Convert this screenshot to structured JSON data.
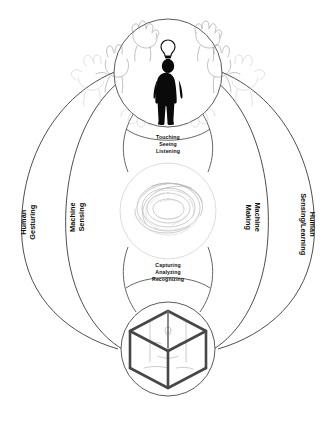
{
  "diagram": {
    "type": "cyclical-interaction-diagram",
    "background_color": "#ffffff",
    "nodes": [
      {
        "id": "human",
        "position": "top",
        "icon": "human-silhouette-with-lightbulb",
        "surrounding_icon": "gesturing-hands-sketches"
      },
      {
        "id": "computation",
        "position": "middle",
        "icon": "tangled-mesh-swirl"
      },
      {
        "id": "machine",
        "position": "bottom",
        "icon": "wireframe-cube-3d-printer"
      }
    ],
    "inner_labels": [
      {
        "id": "top-inner",
        "lines": [
          "Touching",
          "Seeing",
          "Listening"
        ]
      },
      {
        "id": "bottom-inner",
        "lines": [
          "Capturing",
          "Analyzing",
          "Recognizing"
        ]
      }
    ],
    "arc_labels": [
      {
        "id": "human-gesturing",
        "side": "left-outer",
        "lines": [
          "Human",
          "Gesturing"
        ],
        "orientation": "rotated-ccw"
      },
      {
        "id": "machine-sensing",
        "side": "left-inner",
        "lines": [
          "Machine",
          "Sensing"
        ],
        "orientation": "rotated-ccw"
      },
      {
        "id": "machine-making",
        "side": "right-inner",
        "lines": [
          "Machine",
          "Making"
        ],
        "orientation": "rotated-cw"
      },
      {
        "id": "human-sensing-learning",
        "side": "right-outer",
        "lines": [
          "Human",
          "Sensing/Learning"
        ],
        "orientation": "rotated-cw"
      }
    ],
    "colors": {
      "line": "#3a3a3a",
      "silhouette": "#0a0a0a",
      "light_outline": "#d8d8d8",
      "mesh": "#a9a9a9",
      "cube": "#474747",
      "text": "#111111"
    }
  }
}
